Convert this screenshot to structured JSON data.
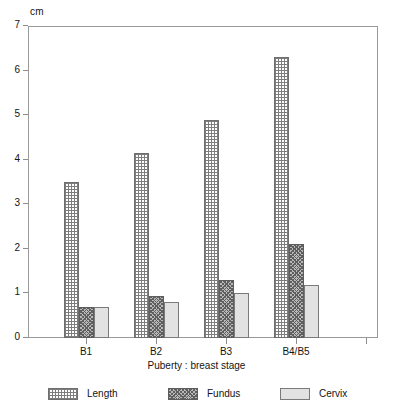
{
  "chart_data": {
    "type": "bar",
    "title": "",
    "xlabel": "Puberty : breast stage",
    "ylabel": "cm",
    "y_unit_label": "cm",
    "categories": [
      "B1",
      "B2",
      "B3",
      "B4/B5"
    ],
    "series": [
      {
        "name": "Length",
        "values": [
          3.5,
          4.15,
          4.9,
          6.3
        ],
        "pattern": "cross-hatch",
        "color": "#7d7d7d"
      },
      {
        "name": "Fundus",
        "values": [
          0.7,
          0.95,
          1.3,
          2.1
        ],
        "pattern": "dense-stipple",
        "color": "#5f5f5f"
      },
      {
        "name": "Cervix",
        "values": [
          0.7,
          0.8,
          1.0,
          1.2
        ],
        "pattern": "solid-light",
        "color": "#e2e2e2"
      }
    ],
    "ylim": [
      0,
      7
    ],
    "ytick_values": [
      0,
      1,
      2,
      3,
      4,
      5,
      6,
      7
    ],
    "ytick_labels": [
      "0",
      "1",
      "2",
      "3",
      "4",
      "5",
      "6",
      "7"
    ],
    "grid": false,
    "legend_position": "bottom"
  },
  "axis": {
    "y_unit": "cm",
    "y_ticks": [
      "7",
      "6",
      "5",
      "4",
      "3",
      "2",
      "1",
      "0"
    ],
    "x_ticks": [
      "B1",
      "B2",
      "B3",
      "B4/B5"
    ],
    "x_title": "Puberty : breast stage"
  },
  "legend": {
    "items": [
      {
        "label": "Length"
      },
      {
        "label": "Fundus"
      },
      {
        "label": "Cervix"
      }
    ]
  }
}
